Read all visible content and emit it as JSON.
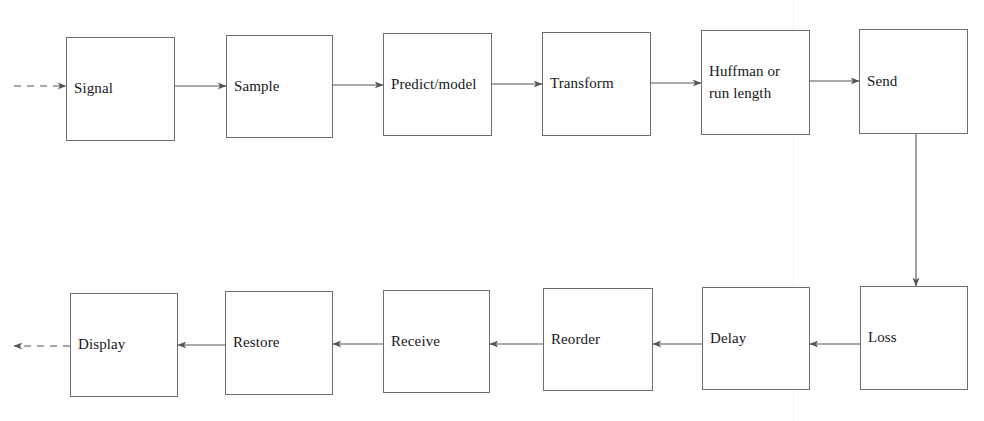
{
  "diagram": {
    "type": "flowchart",
    "background_color": "#ffffff",
    "box_border_color": "#6e6e72",
    "edge_color": "#55555a",
    "text_color": "#17171a",
    "nodes": [
      {
        "id": "signal",
        "label": "Signal",
        "row": "top",
        "x": 66,
        "y": 37,
        "w": 109,
        "h": 104
      },
      {
        "id": "sample",
        "label": "Sample",
        "row": "top",
        "x": 226,
        "y": 35,
        "w": 107,
        "h": 103
      },
      {
        "id": "predict",
        "label": "Predict/model",
        "row": "top",
        "x": 383,
        "y": 33,
        "w": 109,
        "h": 103
      },
      {
        "id": "transform",
        "label": "Transform",
        "row": "top",
        "x": 542,
        "y": 32,
        "w": 109,
        "h": 104
      },
      {
        "id": "huffman",
        "label": "Huffman or\nrun length",
        "row": "top",
        "x": 701,
        "y": 30,
        "w": 109,
        "h": 105
      },
      {
        "id": "send",
        "label": "Send",
        "row": "top",
        "x": 859,
        "y": 29,
        "w": 109,
        "h": 105
      },
      {
        "id": "display",
        "label": "Display",
        "row": "bottom",
        "x": 70,
        "y": 293,
        "w": 108,
        "h": 104
      },
      {
        "id": "restore",
        "label": "Restore",
        "row": "bottom",
        "x": 225,
        "y": 291,
        "w": 108,
        "h": 104
      },
      {
        "id": "receive",
        "label": "Receive",
        "row": "bottom",
        "x": 383,
        "y": 290,
        "w": 107,
        "h": 103
      },
      {
        "id": "reorder",
        "label": "Reorder",
        "row": "bottom",
        "x": 543,
        "y": 288,
        "w": 110,
        "h": 103
      },
      {
        "id": "delay",
        "label": "Delay",
        "row": "bottom",
        "x": 702,
        "y": 287,
        "w": 108,
        "h": 103
      },
      {
        "id": "loss",
        "label": "Loss",
        "row": "bottom",
        "x": 860,
        "y": 286,
        "w": 108,
        "h": 104
      }
    ],
    "edges": [
      {
        "id": "in-signal",
        "from": "input",
        "to": "signal",
        "style": "dashed",
        "direction": "right",
        "x1": 14,
        "y1": 86,
        "x2": 66,
        "y2": 86
      },
      {
        "id": "signal-sample",
        "from": "signal",
        "to": "sample",
        "style": "solid",
        "direction": "right",
        "x1": 175,
        "y1": 86,
        "x2": 226,
        "y2": 86
      },
      {
        "id": "sample-predict",
        "from": "sample",
        "to": "predict",
        "style": "solid",
        "direction": "right",
        "x1": 333,
        "y1": 85,
        "x2": 383,
        "y2": 85
      },
      {
        "id": "predict-transform",
        "from": "predict",
        "to": "transform",
        "style": "solid",
        "direction": "right",
        "x1": 492,
        "y1": 84,
        "x2": 542,
        "y2": 84
      },
      {
        "id": "transform-huffman",
        "from": "transform",
        "to": "huffman",
        "style": "solid",
        "direction": "right",
        "x1": 651,
        "y1": 83,
        "x2": 701,
        "y2": 83
      },
      {
        "id": "huffman-send",
        "from": "huffman",
        "to": "send",
        "style": "solid",
        "direction": "right",
        "x1": 810,
        "y1": 81,
        "x2": 859,
        "y2": 81
      },
      {
        "id": "send-loss",
        "from": "send",
        "to": "loss",
        "style": "solid",
        "direction": "down",
        "x1": 916,
        "y1": 134,
        "x2": 916,
        "y2": 286
      },
      {
        "id": "loss-delay",
        "from": "loss",
        "to": "delay",
        "style": "solid",
        "direction": "left",
        "x1": 860,
        "y1": 344,
        "x2": 810,
        "y2": 344
      },
      {
        "id": "delay-reorder",
        "from": "delay",
        "to": "reorder",
        "style": "solid",
        "direction": "left",
        "x1": 702,
        "y1": 344,
        "x2": 653,
        "y2": 344
      },
      {
        "id": "reorder-receive",
        "from": "reorder",
        "to": "receive",
        "style": "solid",
        "direction": "left",
        "x1": 543,
        "y1": 344,
        "x2": 490,
        "y2": 344
      },
      {
        "id": "receive-restore",
        "from": "receive",
        "to": "restore",
        "style": "solid",
        "direction": "left",
        "x1": 383,
        "y1": 344,
        "x2": 333,
        "y2": 344
      },
      {
        "id": "restore-display",
        "from": "restore",
        "to": "display",
        "style": "solid",
        "direction": "left",
        "x1": 225,
        "y1": 345,
        "x2": 178,
        "y2": 345
      },
      {
        "id": "display-out",
        "from": "display",
        "to": "output",
        "style": "dashed",
        "direction": "left",
        "x1": 70,
        "y1": 346,
        "x2": 14,
        "y2": 346
      }
    ],
    "artifacts": [
      {
        "id": "scan-line",
        "x": 793
      }
    ]
  }
}
